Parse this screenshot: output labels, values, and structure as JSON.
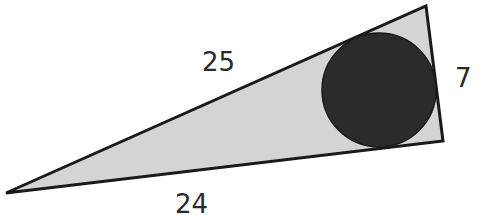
{
  "diagram": {
    "type": "right-triangle-with-inscribed-circle",
    "colors": {
      "triangle_fill": "#d4d4d4",
      "triangle_stroke": "#1a1a1a",
      "circle_fill": "#2b2b2b",
      "label": "#2a2a2a"
    },
    "triangle": {
      "vertices": [
        [
          6,
          193
        ],
        [
          426,
          6
        ],
        [
          443,
          141
        ]
      ]
    },
    "circle": {
      "cx": 379,
      "cy": 90,
      "r": 57
    },
    "labels": {
      "hypotenuse": "25",
      "short_leg": "7",
      "long_leg": "24"
    }
  }
}
